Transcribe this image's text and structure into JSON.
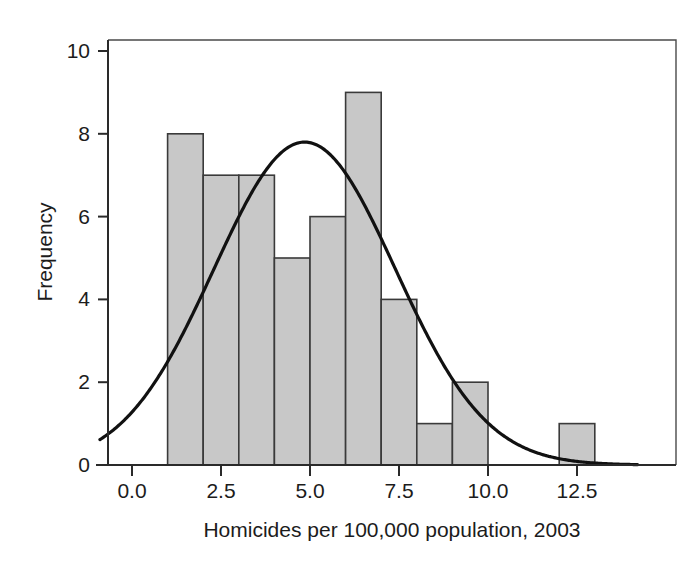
{
  "chart_data": {
    "type": "bar",
    "title": "",
    "subtitle": "",
    "xlabel": "Homicides per 100,000 population, 2003",
    "ylabel": "Frequency",
    "xlim": [
      -0.9,
      14.2
    ],
    "ylim": [
      0,
      10.6
    ],
    "xticks": [
      "0.0",
      "2.5",
      "5.0",
      "7.5",
      "10.0",
      "12.5"
    ],
    "xtick_values": [
      0.0,
      2.5,
      5.0,
      7.5,
      10.0,
      12.5
    ],
    "yticks": [
      "0",
      "2",
      "4",
      "6",
      "8",
      "10"
    ],
    "ytick_values": [
      0,
      2,
      4,
      6,
      8,
      10
    ],
    "grid": false,
    "legend": "none",
    "bin_width": 1.0,
    "bar_color": "#c8c8c8",
    "bar_edge_color": "#3a3a3a",
    "curve_color": "#111111",
    "bins": [
      {
        "left": 1.0,
        "right": 2.0,
        "center": 1.5,
        "value": 8
      },
      {
        "left": 2.0,
        "right": 3.0,
        "center": 2.5,
        "value": 7
      },
      {
        "left": 3.0,
        "right": 4.0,
        "center": 3.5,
        "value": 7
      },
      {
        "left": 4.0,
        "right": 5.0,
        "center": 4.5,
        "value": 5
      },
      {
        "left": 5.0,
        "right": 6.0,
        "center": 5.5,
        "value": 6
      },
      {
        "left": 6.0,
        "right": 7.0,
        "center": 6.5,
        "value": 9
      },
      {
        "left": 7.0,
        "right": 8.0,
        "center": 7.5,
        "value": 4
      },
      {
        "left": 8.0,
        "right": 9.0,
        "center": 8.5,
        "value": 1
      },
      {
        "left": 9.0,
        "right": 10.0,
        "center": 9.5,
        "value": 2
      },
      {
        "left": 10.0,
        "right": 11.0,
        "center": 10.5,
        "value": 0
      },
      {
        "left": 11.0,
        "right": 12.0,
        "center": 11.5,
        "value": 0
      },
      {
        "left": 12.0,
        "right": 13.0,
        "center": 12.5,
        "value": 1
      }
    ],
    "categories": [
      "1.5",
      "2.5",
      "3.5",
      "4.5",
      "5.5",
      "6.5",
      "7.5",
      "8.5",
      "9.5",
      "10.5",
      "11.5",
      "12.5"
    ],
    "values": [
      8,
      7,
      7,
      5,
      6,
      9,
      4,
      1,
      2,
      0,
      0,
      1
    ],
    "overlay_curve": {
      "name": "normal-distribution-fit",
      "type": "normal",
      "mean": 4.85,
      "std_dev": 2.55,
      "peak_value": 7.8,
      "amplitude": 7.8
    }
  }
}
